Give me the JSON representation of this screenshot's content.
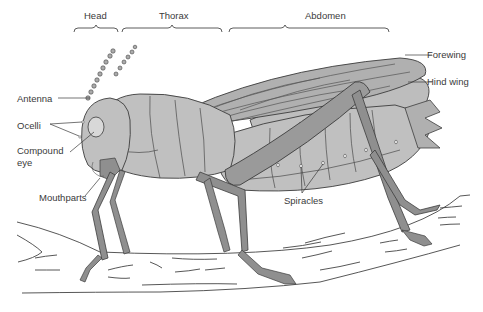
{
  "diagram": {
    "regions": [
      {
        "label": "Head"
      },
      {
        "label": "Thorax"
      },
      {
        "label": "Abdomen"
      }
    ],
    "labels": {
      "antenna": "Antenna",
      "ocelli": "Ocelli",
      "compound_eye_1": "Compound",
      "compound_eye_2": "eye",
      "mouthparts": "Mouthparts",
      "forewing": "Forewing",
      "hind_wing": "Hind wing",
      "spiracles": "Spiracles"
    },
    "colors": {
      "body": "#b8b8b8",
      "body_dark": "#8f8f8f",
      "wing": "#a9a9a9",
      "outline": "#3c3c3c",
      "branch": "#ffffff",
      "text": "#3a3a3a"
    }
  }
}
